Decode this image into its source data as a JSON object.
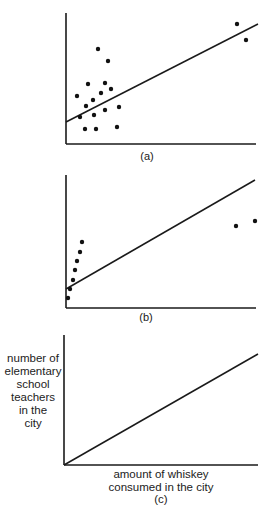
{
  "chart_data": [
    {
      "type": "scatter",
      "id": "a",
      "caption": "(a)",
      "xlabel": "",
      "ylabel": "",
      "grid": false,
      "note": "Scatter of points clustered at lower-left plus two outliers at upper-right, with fitted regression line",
      "points_px": [
        [
          98,
          49
        ],
        [
          108,
          61
        ],
        [
          88,
          84
        ],
        [
          105,
          83
        ],
        [
          77,
          96
        ],
        [
          101,
          93
        ],
        [
          111,
          89
        ],
        [
          93,
          100
        ],
        [
          86,
          106
        ],
        [
          105,
          110
        ],
        [
          119,
          107
        ],
        [
          94,
          115
        ],
        [
          80,
          117
        ],
        [
          85,
          129
        ],
        [
          96,
          129
        ],
        [
          117,
          127
        ],
        [
          237,
          24
        ],
        [
          246,
          40
        ]
      ],
      "regression_line_px": [
        [
          66,
          122
        ],
        [
          258,
          24
        ]
      ]
    },
    {
      "type": "scatter",
      "id": "b",
      "caption": "(b)",
      "xlabel": "",
      "ylabel": "",
      "grid": false,
      "note": "Steep column of points near origin plus two outliers at right, with fitted regression line",
      "points_px": [
        [
          68,
          298
        ],
        [
          70,
          289
        ],
        [
          73,
          280
        ],
        [
          75,
          270
        ],
        [
          77,
          261
        ],
        [
          80,
          252
        ],
        [
          82,
          242
        ],
        [
          236,
          226
        ],
        [
          255,
          221
        ]
      ],
      "regression_line_px": [
        [
          66,
          289
        ],
        [
          255,
          180
        ]
      ]
    },
    {
      "type": "line",
      "id": "c",
      "caption": "(c)",
      "xlabel": "amount of whiskey consumed in the city",
      "ylabel": "number of elementary school teachers in the city",
      "grid": false,
      "line_px": [
        [
          64,
          465
        ],
        [
          258,
          354
        ]
      ]
    }
  ],
  "panels": {
    "a": {
      "caption": "(a)"
    },
    "b": {
      "caption": "(b)"
    },
    "c": {
      "caption": "(c)",
      "ylabel_lines": [
        "number of",
        "elementary",
        "school",
        "teachers",
        "in the",
        "city"
      ],
      "xlabel_lines": [
        "amount of whiskey",
        "consumed in the city"
      ]
    }
  }
}
